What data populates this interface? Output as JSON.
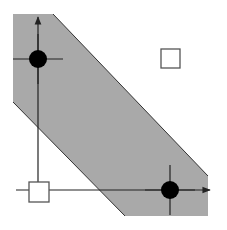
{
  "diagram": {
    "colors": {
      "background": "#ffffff",
      "band_fill": "#a9a9a9",
      "band_edge": "#333333",
      "axis": "#222222",
      "filled_point": "#000000",
      "hollow_point_stroke": "#555555",
      "hollow_point_fill": "#ffffff"
    },
    "band": {
      "points": "13,14 53,14 208,176 208,216 125,216 13,102"
    },
    "axes": {
      "vertical": {
        "x": 38,
        "y_top": 17,
        "y_bottom": 192
      },
      "horizontal": {
        "y": 190,
        "x_left": 16,
        "x_right": 210
      }
    },
    "filled_points": [
      {
        "cx": 38,
        "cy": 59,
        "r": 9,
        "cross_half": 25
      },
      {
        "cx": 170,
        "cy": 190,
        "r": 9,
        "cross_half": 25
      }
    ],
    "hollow_points": [
      {
        "x": 29,
        "y": 182,
        "size": 20
      },
      {
        "x": 161,
        "y": 49,
        "size": 19
      }
    ]
  }
}
